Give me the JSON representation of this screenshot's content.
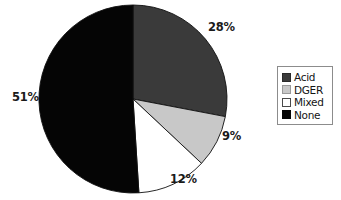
{
  "chart_data": {
    "type": "pie",
    "title": "",
    "labels": [
      "Acid",
      "DGER",
      "Mixed",
      "None"
    ],
    "values": [
      28,
      9,
      12,
      51
    ],
    "value_labels": [
      "28%",
      "9%",
      "12%",
      "51%"
    ],
    "units": "percent",
    "start_angle_deg": 0,
    "direction": "clockwise",
    "colors": [
      "#3a3a3a",
      "#c8c8c8",
      "#ffffff",
      "#050505"
    ],
    "slice_border_color": "#111111",
    "legend_position": "right",
    "grid": false,
    "background": "#ffffff"
  },
  "legend": {
    "items": [
      {
        "label": "Acid",
        "swatch": "dark-gray-swatch",
        "color": "#3a3a3a"
      },
      {
        "label": "DGER",
        "swatch": "light-gray-swatch",
        "color": "#c8c8c8"
      },
      {
        "label": "Mixed",
        "swatch": "white-swatch",
        "color": "#ffffff"
      },
      {
        "label": "None",
        "swatch": "black-swatch",
        "color": "#050505"
      }
    ]
  },
  "labels": {
    "acid": "28%",
    "dger": "9%",
    "mixed": "12%",
    "none": "51%"
  }
}
